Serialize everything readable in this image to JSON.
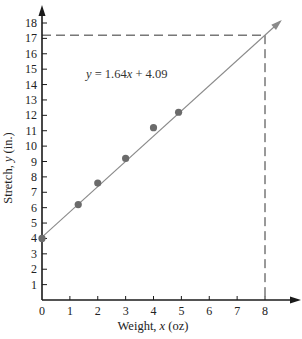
{
  "chart_data": {
    "type": "scatter",
    "title": "",
    "xlabel": "Weight, x (oz)",
    "ylabel": "Stretch, y (in.)",
    "xlim": [
      0,
      8
    ],
    "ylim": [
      0,
      18
    ],
    "x_ticks": [
      "0",
      "1",
      "2",
      "3",
      "4",
      "5",
      "6",
      "7",
      "8"
    ],
    "y_ticks": [
      "1",
      "2",
      "3",
      "4",
      "5",
      "6",
      "7",
      "8",
      "9",
      "10",
      "11",
      "12",
      "13",
      "14",
      "15",
      "16",
      "17",
      "18"
    ],
    "grid": false,
    "legend": null,
    "series": [
      {
        "name": "observations",
        "type": "scatter",
        "points": [
          {
            "x": 0,
            "y": 4.0
          },
          {
            "x": 1.3,
            "y": 6.2
          },
          {
            "x": 2,
            "y": 7.6
          },
          {
            "x": 3,
            "y": 9.2
          },
          {
            "x": 4,
            "y": 11.2
          },
          {
            "x": 4.9,
            "y": 12.2
          }
        ]
      },
      {
        "name": "regression line",
        "type": "line",
        "slope": 1.64,
        "intercept": 4.09
      }
    ],
    "annotations": [
      {
        "text": "y = 1.64x + 4.09",
        "kind": "equation"
      },
      {
        "kind": "dashed-guide",
        "x": 8,
        "y": 17.21
      }
    ]
  },
  "labels": {
    "equation": "y = 1.64x + 4.09",
    "xlabel_prefix": "Weight, ",
    "xlabel_var": "x",
    "xlabel_suffix": " (oz)",
    "ylabel_prefix": "Stretch, ",
    "ylabel_var": "y",
    "ylabel_suffix": " (in.)"
  },
  "colors": {
    "axis": "#1a1a1a",
    "line": "#8a8a8a",
    "point": "#6b6b6b",
    "dash": "#333333"
  }
}
